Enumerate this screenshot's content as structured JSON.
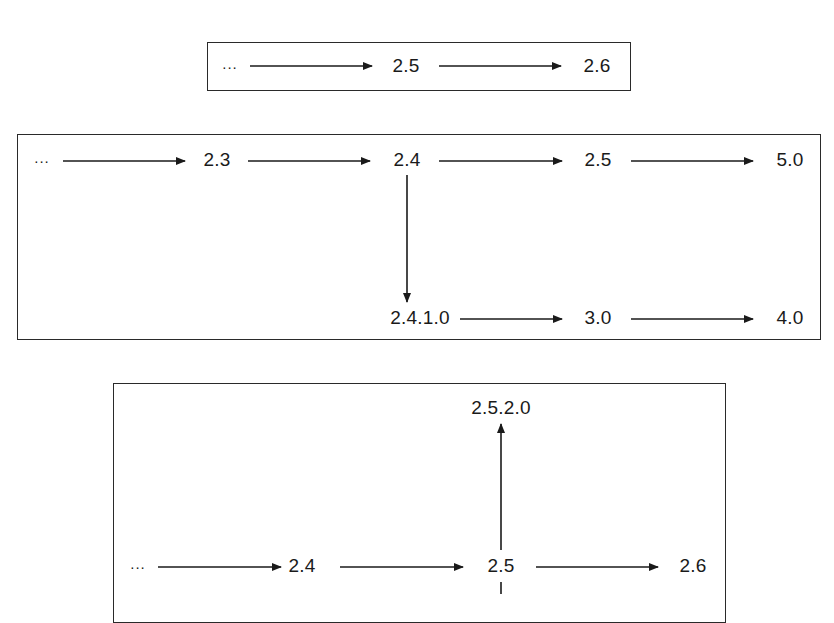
{
  "diagrams": [
    {
      "name": "linear-versioning",
      "nodes": [
        {
          "id": "a0",
          "label": "...",
          "x": 230,
          "y": 66
        },
        {
          "id": "a1",
          "label": "2.5",
          "x": 406,
          "y": 66
        },
        {
          "id": "a2",
          "label": "2.6",
          "x": 597,
          "y": 66
        }
      ],
      "edges": [
        [
          "a0",
          "a1"
        ],
        [
          "a1",
          "a2"
        ]
      ]
    },
    {
      "name": "branch-renumbered-versioning",
      "nodes": [
        {
          "id": "b0",
          "label": "...",
          "x": 42,
          "y": 160
        },
        {
          "id": "b1",
          "label": "2.3",
          "x": 217,
          "y": 160
        },
        {
          "id": "b2",
          "label": "2.4",
          "x": 407,
          "y": 160
        },
        {
          "id": "b3",
          "label": "2.5",
          "x": 598,
          "y": 160
        },
        {
          "id": "b4",
          "label": "5.0",
          "x": 790,
          "y": 160
        },
        {
          "id": "b5",
          "label": "2.4.1.0",
          "x": 420,
          "y": 318
        },
        {
          "id": "b6",
          "label": "3.0",
          "x": 598,
          "y": 318
        },
        {
          "id": "b7",
          "label": "4.0",
          "x": 790,
          "y": 318
        }
      ],
      "edges": [
        [
          "b0",
          "b1"
        ],
        [
          "b1",
          "b2"
        ],
        [
          "b2",
          "b3"
        ],
        [
          "b3",
          "b4"
        ],
        [
          "b2",
          "b5"
        ],
        [
          "b5",
          "b6"
        ],
        [
          "b6",
          "b7"
        ]
      ]
    },
    {
      "name": "branch-up-and-down-versioning",
      "nodes": [
        {
          "id": "c0",
          "label": "...",
          "x": 138,
          "y": 566
        },
        {
          "id": "c1",
          "label": "2.4",
          "x": 302,
          "y": 566
        },
        {
          "id": "c2",
          "label": "2.5",
          "x": 501,
          "y": 566
        },
        {
          "id": "c3",
          "label": "2.6",
          "x": 693,
          "y": 566
        },
        {
          "id": "c4",
          "label": "2.5.2.0",
          "x": 501,
          "y": 408
        }
      ],
      "edges": [
        [
          "c0",
          "c1"
        ],
        [
          "c1",
          "c2"
        ],
        [
          "c2",
          "c3"
        ],
        [
          "c2",
          "c4"
        ]
      ],
      "continues_below": true
    }
  ],
  "colors": {
    "line": "#1a1a1a",
    "border": "#2a2a2a",
    "background": "#ffffff"
  }
}
